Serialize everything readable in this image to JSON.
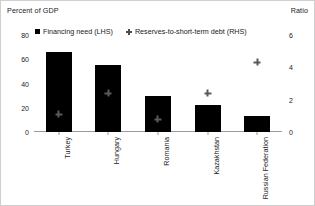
{
  "axes": {
    "left_unit_label": "Percent of GDP",
    "right_unit_label": "Ratio"
  },
  "legend": {
    "items": [
      {
        "label": "Financing need (LHS)",
        "marker": "square-marker",
        "color": "#000000"
      },
      {
        "label": "Reserves-to-short-term debt (RHS)",
        "marker": "diamond-marker",
        "color": "#5a5a5a"
      }
    ]
  },
  "yaxis_left": {
    "ticks": [
      "0",
      "20",
      "40",
      "60",
      "80"
    ]
  },
  "yaxis_right": {
    "ticks": [
      "0",
      "2",
      "4",
      "6"
    ]
  },
  "categories": [
    "Turkey",
    "Hungary",
    "Romania",
    "Kazakhstan",
    "Russian Federation"
  ],
  "chart_data": {
    "type": "bar",
    "title": "",
    "subtitle": "",
    "xlabel": "",
    "ylabel": "Percent of GDP",
    "y2label": "Ratio",
    "categories": [
      "Turkey",
      "Hungary",
      "Romania",
      "Kazakhstan",
      "Russian Federation"
    ],
    "series": [
      {
        "name": "Financing need (LHS)",
        "axis": "left",
        "type": "bar",
        "color": "#000000",
        "values": [
          66,
          55,
          30,
          22,
          13
        ]
      },
      {
        "name": "Reserves-to-short-term debt (RHS)",
        "axis": "right",
        "type": "scatter",
        "color": "#5a5a5a",
        "values": [
          1.1,
          2.4,
          0.8,
          2.4,
          4.3
        ]
      }
    ],
    "ylim": [
      0,
      80
    ],
    "y2lim": [
      0,
      6
    ],
    "yticks": [
      0,
      20,
      40,
      60,
      80
    ],
    "y2ticks": [
      0,
      2,
      4,
      6
    ],
    "grid": false,
    "legend_position": "top"
  }
}
